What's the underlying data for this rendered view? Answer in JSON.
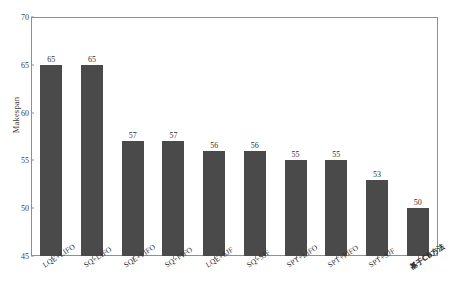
{
  "chart_data": {
    "type": "bar",
    "title": "",
    "subtitle": "",
    "xlabel": "",
    "ylabel": "Makespan",
    "ylim": [
      45,
      70
    ],
    "yticks": [
      45,
      50,
      55,
      60,
      65,
      70
    ],
    "grid": false,
    "legend": null,
    "bar_color": "#4a4a4a",
    "axis_color": "#8f8f8f",
    "categories": [
      "LQE+LIFO",
      "SQ+LIFO",
      "SQE+FIFO",
      "SQ+FIFO",
      "LQE+SJF",
      "SQ+SJF",
      "SPT+LIFO",
      "SPT+FIFO",
      "SPT+SJF",
      "基于CB方法"
    ],
    "values": [
      65,
      65,
      57,
      57,
      56,
      56,
      55,
      55,
      53,
      50
    ],
    "bars": [
      {
        "category": "LQE+LIFO",
        "value": 65,
        "label": "65",
        "cjk": false
      },
      {
        "category": "SQ+LIFO",
        "value": 65,
        "label": "65",
        "cjk": false
      },
      {
        "category": "SQE+FIFO",
        "value": 57,
        "label": "57",
        "cjk": false
      },
      {
        "category": "SQ+FIFO",
        "value": 57,
        "label": "57",
        "cjk": false
      },
      {
        "category": "LQE+SJF",
        "value": 56,
        "label": "56",
        "cjk": false
      },
      {
        "category": "SQ+SJF",
        "value": 56,
        "label": "56",
        "cjk": false
      },
      {
        "category": "SPT+LIFO",
        "value": 55,
        "label": "55",
        "cjk": false
      },
      {
        "category": "SPT+FIFO",
        "value": 55,
        "label": "55",
        "cjk": false
      },
      {
        "category": "SPT+SJF",
        "value": 53,
        "label": "53",
        "cjk": false
      },
      {
        "category": "基于CB方法",
        "value": 50,
        "label": "50",
        "cjk": true
      }
    ]
  }
}
